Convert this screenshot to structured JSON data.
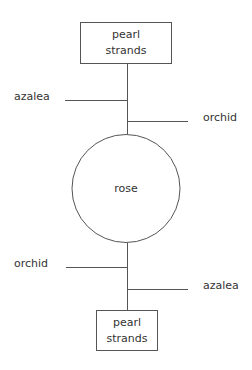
{
  "diagram": {
    "top_box": {
      "line1": "pearl",
      "line2": "strands"
    },
    "top_left_branch": {
      "label": "azalea"
    },
    "top_right_branch": {
      "label": "orchid"
    },
    "center_circle": {
      "label": "rose"
    },
    "bottom_left_branch": {
      "label": "orchid"
    },
    "bottom_right_branch": {
      "label": "azalea"
    },
    "bottom_box": {
      "line1": "pearl",
      "line2": "strands"
    }
  },
  "colors": {
    "line": "#555555",
    "text": "#333333",
    "background": "#ffffff"
  }
}
